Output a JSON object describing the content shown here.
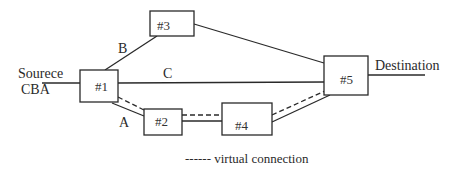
{
  "diagram": {
    "source_label_line1": "Sourece",
    "source_label_line2": "CBA",
    "destination_label": "Destination",
    "nodes": [
      {
        "id": "n1",
        "label": "#1"
      },
      {
        "id": "n2",
        "label": "#2"
      },
      {
        "id": "n3",
        "label": "#3"
      },
      {
        "id": "n4",
        "label": "#4"
      },
      {
        "id": "n5",
        "label": "#5"
      }
    ],
    "edges": [
      {
        "label": "A",
        "from": "#1",
        "to": "#2"
      },
      {
        "label": "B",
        "from": "#1",
        "to": "#3"
      },
      {
        "label": "C",
        "from": "#1",
        "to": "#5"
      }
    ],
    "legend": "------ virtual connection"
  }
}
